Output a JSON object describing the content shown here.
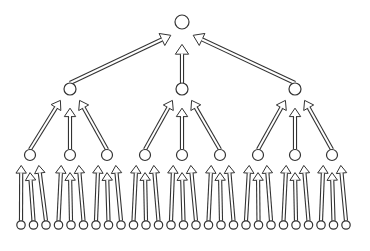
{
  "diagram": {
    "type": "tree",
    "levels": 4,
    "branching_factor": 3,
    "colors": {
      "stroke": "#333333",
      "fill": "#ffffff",
      "background": "#ffffff"
    },
    "root": {
      "x": 182,
      "y": 22,
      "r": 7
    },
    "level1": {
      "y": 89,
      "r": 6,
      "xs": [
        70,
        182,
        295
      ]
    },
    "level2": {
      "y": 155,
      "r": 5.5,
      "xs": [
        30,
        70,
        107,
        145,
        182,
        220,
        258,
        295,
        332
      ]
    },
    "level3": {
      "y": 225,
      "r": 4.2,
      "x_start": 21,
      "spacing": 12.5,
      "count": 27
    },
    "node_counts": {
      "root": 1,
      "level1": 3,
      "level2": 9,
      "leaves": 27
    }
  }
}
